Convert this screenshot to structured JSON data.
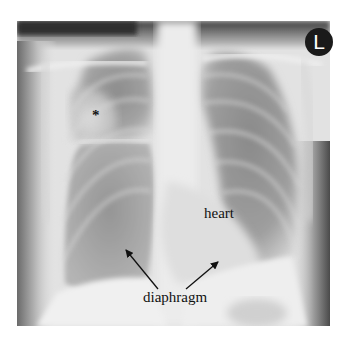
{
  "image": {
    "type": "chest-radiograph-pa",
    "orientation_marker": "L",
    "annotations": {
      "asterisk": "*",
      "heart": "heart",
      "diaphragm": "diaphragm"
    }
  },
  "colors": {
    "background": "#ffffff",
    "marker_bg": "#1a1a1a",
    "marker_fg": "#ffffff",
    "label_text": "#111111",
    "lung_dark": "#8a8a8a",
    "soft_tissue": "#e8e8e8"
  }
}
